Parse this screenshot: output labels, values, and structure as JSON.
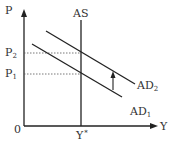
{
  "diagram": {
    "axes": {
      "y_label": "P",
      "x_label": "Y",
      "origin_label": "0"
    },
    "curves": {
      "as_label": "AS",
      "ad1_label": "AD",
      "ad1_sub": "1",
      "ad2_label": "AD",
      "ad2_sub": "2"
    },
    "price_levels": {
      "p1_label": "P",
      "p1_sub": "1",
      "p2_label": "P",
      "p2_sub": "2"
    },
    "output_level": {
      "label": "Y",
      "sup": "*"
    },
    "shift_arrow": "upward shift from AD1 to AD2",
    "colors": {
      "line": "#222222",
      "dashed": "#555555",
      "text": "#333333"
    }
  }
}
